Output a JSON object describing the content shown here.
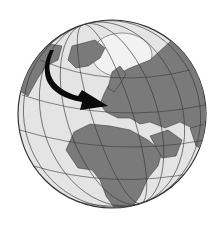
{
  "image": {
    "subject": "globe centered on Europe, Africa and Middle East with arrow from North Atlantic to Europe",
    "colors": {
      "background": "#ffffff",
      "ocean": "#e4e4e4",
      "land": "#7a7a7a",
      "graticule": "#3a3a3a",
      "arrow": "#0a0a0a",
      "ice": "#f0f0f0"
    }
  }
}
